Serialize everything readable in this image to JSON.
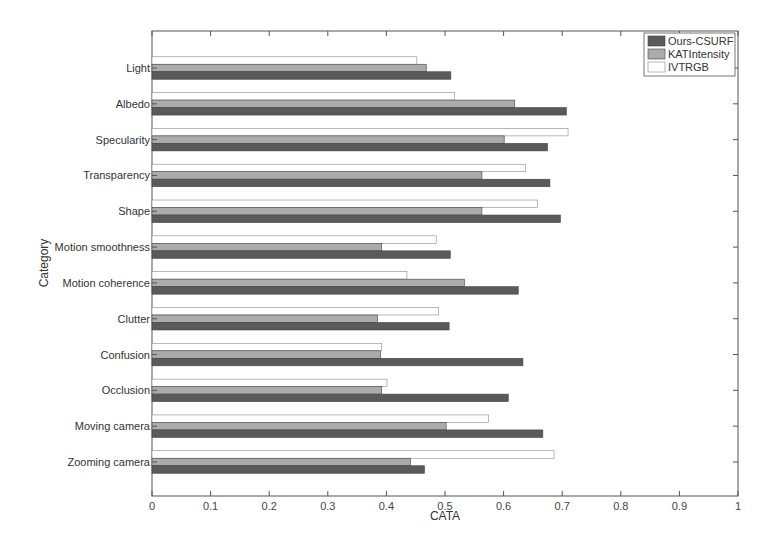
{
  "chart_data": {
    "type": "bar",
    "orientation": "horizontal",
    "title": "",
    "xlabel": "CATA",
    "ylabel": "Category",
    "xlim": [
      0,
      1
    ],
    "xticks": [
      "0",
      "0.1",
      "0.2",
      "0.3",
      "0.4",
      "0.5",
      "0.6",
      "0.7",
      "0.8",
      "0.9",
      "1"
    ],
    "grid": false,
    "legend_position": "top-right",
    "categories": [
      "Light",
      "Albedo",
      "Specularity",
      "Transparency",
      "Shape",
      "Motion smoothness",
      "Motion coherence",
      "Clutter",
      "Confusion",
      "Occlusion",
      "Moving camera",
      "Zooming camera"
    ],
    "series": [
      {
        "name": "Ours-CSURF",
        "color": "#5a5a5a",
        "values": [
          0.51,
          0.707,
          0.675,
          0.679,
          0.697,
          0.509,
          0.625,
          0.507,
          0.633,
          0.608,
          0.667,
          0.465
        ]
      },
      {
        "name": "KATIntensity",
        "color": "#ababab",
        "values": [
          0.468,
          0.619,
          0.601,
          0.563,
          0.563,
          0.392,
          0.533,
          0.385,
          0.39,
          0.392,
          0.502,
          0.441
        ]
      },
      {
        "name": "IVTRGB",
        "color": "#ffffff",
        "values": [
          0.452,
          0.516,
          0.71,
          0.637,
          0.658,
          0.485,
          0.435,
          0.489,
          0.392,
          0.401,
          0.574,
          0.686
        ]
      }
    ]
  }
}
